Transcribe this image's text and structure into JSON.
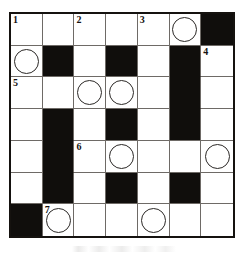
{
  "puzzle": {
    "kind": "crossword-grid",
    "rows": 7,
    "columns": 7,
    "colors": {
      "block_fill": "#100e0c",
      "cell_fill": "#ffffff",
      "grid_line": "#6e6a66",
      "border": "#15120f",
      "circle_stroke": "#2b2826",
      "number_color": "#15120f"
    },
    "clue_numbers": [
      "1",
      "2",
      "3",
      "4",
      "5",
      "6",
      "7"
    ],
    "grid": [
      [
        {
          "type": "open",
          "number": "1",
          "circle": false
        },
        {
          "type": "open",
          "number": "",
          "circle": false
        },
        {
          "type": "open",
          "number": "2",
          "circle": false
        },
        {
          "type": "open",
          "number": "",
          "circle": false
        },
        {
          "type": "open",
          "number": "3",
          "circle": false
        },
        {
          "type": "open",
          "number": "",
          "circle": true
        },
        {
          "type": "block",
          "number": "",
          "circle": false
        }
      ],
      [
        {
          "type": "open",
          "number": "",
          "circle": true
        },
        {
          "type": "block",
          "number": "",
          "circle": false
        },
        {
          "type": "open",
          "number": "",
          "circle": false
        },
        {
          "type": "block",
          "number": "",
          "circle": false
        },
        {
          "type": "open",
          "number": "",
          "circle": false
        },
        {
          "type": "block",
          "number": "",
          "circle": false
        },
        {
          "type": "open",
          "number": "4",
          "circle": false
        }
      ],
      [
        {
          "type": "open",
          "number": "5",
          "circle": false
        },
        {
          "type": "open",
          "number": "",
          "circle": false
        },
        {
          "type": "open",
          "number": "",
          "circle": true
        },
        {
          "type": "open",
          "number": "",
          "circle": true
        },
        {
          "type": "open",
          "number": "",
          "circle": false
        },
        {
          "type": "block",
          "number": "",
          "circle": false
        },
        {
          "type": "open",
          "number": "",
          "circle": false
        }
      ],
      [
        {
          "type": "open",
          "number": "",
          "circle": false
        },
        {
          "type": "block",
          "number": "",
          "circle": false
        },
        {
          "type": "open",
          "number": "",
          "circle": false
        },
        {
          "type": "block",
          "number": "",
          "circle": false
        },
        {
          "type": "open",
          "number": "",
          "circle": false
        },
        {
          "type": "block",
          "number": "",
          "circle": false
        },
        {
          "type": "open",
          "number": "",
          "circle": false
        }
      ],
      [
        {
          "type": "open",
          "number": "",
          "circle": false
        },
        {
          "type": "block",
          "number": "",
          "circle": false
        },
        {
          "type": "open",
          "number": "6",
          "circle": false
        },
        {
          "type": "open",
          "number": "",
          "circle": true
        },
        {
          "type": "open",
          "number": "",
          "circle": false
        },
        {
          "type": "open",
          "number": "",
          "circle": false
        },
        {
          "type": "open",
          "number": "",
          "circle": true
        }
      ],
      [
        {
          "type": "open",
          "number": "",
          "circle": false
        },
        {
          "type": "block",
          "number": "",
          "circle": false
        },
        {
          "type": "open",
          "number": "",
          "circle": false
        },
        {
          "type": "block",
          "number": "",
          "circle": false
        },
        {
          "type": "open",
          "number": "",
          "circle": false
        },
        {
          "type": "block",
          "number": "",
          "circle": false
        },
        {
          "type": "open",
          "number": "",
          "circle": false
        }
      ],
      [
        {
          "type": "block",
          "number": "",
          "circle": false
        },
        {
          "type": "open",
          "number": "7",
          "circle": true
        },
        {
          "type": "open",
          "number": "",
          "circle": false
        },
        {
          "type": "open",
          "number": "",
          "circle": false
        },
        {
          "type": "open",
          "number": "",
          "circle": true
        },
        {
          "type": "open",
          "number": "",
          "circle": false
        },
        {
          "type": "open",
          "number": "",
          "circle": false
        }
      ]
    ]
  }
}
